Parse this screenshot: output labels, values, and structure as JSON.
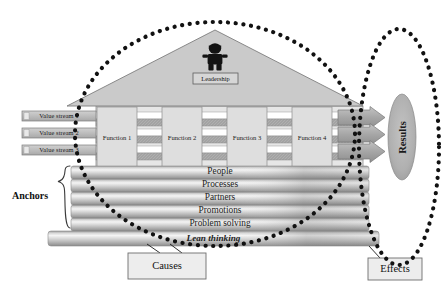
{
  "diagram": {
    "type": "conceptual-diagram"
  },
  "roof": {
    "leadership_label": "Leadership",
    "figure_icon": "person-icon"
  },
  "value_streams": [
    {
      "label": "Value stream 1"
    },
    {
      "label": "Value stream 2"
    },
    {
      "label": "Value stream 3"
    }
  ],
  "functions": [
    {
      "label": "Function 1"
    },
    {
      "label": "Function 2"
    },
    {
      "label": "Function 3"
    },
    {
      "label": "Function 4"
    }
  ],
  "anchors": {
    "bracket_label": "Anchors",
    "logs": [
      {
        "label": "People"
      },
      {
        "label": "Processes"
      },
      {
        "label": "Partners"
      },
      {
        "label": "Promotions"
      },
      {
        "label": "Problem solving"
      }
    ]
  },
  "foundation": {
    "label": "Lean thinking"
  },
  "results": {
    "label": "Results",
    "arrow_count": 3
  },
  "callouts": {
    "causes": "Causes",
    "effects": "Effects"
  },
  "colors": {
    "roof_fill": "#c9c9c9",
    "house_fill": "#e3e3e3",
    "function_fill": "#dcdcdc",
    "stripe_dark": "#9a9a9a",
    "stripe_light": "#ffffff",
    "log_light": "#f2f2f2",
    "log_mid": "#c6c6c6",
    "log_dark": "#8f8f8f",
    "dotted": "#111111",
    "results_fill": "#b3b3b3",
    "outline": "#6b6b6b",
    "callout_fill": "#ededed"
  }
}
